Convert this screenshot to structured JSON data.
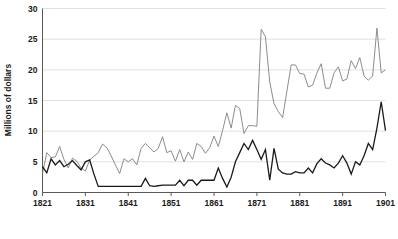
{
  "chart_data": {
    "type": "line",
    "title": "",
    "xlabel": "",
    "ylabel": "Millions of dollars",
    "xlim": [
      1821,
      1901
    ],
    "ylim": [
      0,
      30
    ],
    "grid": true,
    "legend_position": "bottom",
    "ytick_labels": [
      "0",
      "5",
      "10",
      "15",
      "20",
      "25",
      "30"
    ],
    "ytick_values": [
      0,
      5,
      10,
      15,
      20,
      25,
      30
    ],
    "xtick_labels": [
      "1821",
      "1831",
      "1841",
      "1851",
      "1861",
      "1871",
      "1881",
      "1891",
      "1901"
    ],
    "xtick_values": [
      1821,
      1831,
      1841,
      1851,
      1861,
      1871,
      1881,
      1891,
      1901
    ],
    "x": [
      1821,
      1822,
      1823,
      1824,
      1825,
      1826,
      1827,
      1828,
      1829,
      1830,
      1831,
      1832,
      1833,
      1834,
      1835,
      1836,
      1837,
      1838,
      1839,
      1840,
      1841,
      1842,
      1843,
      1844,
      1845,
      1846,
      1847,
      1848,
      1849,
      1850,
      1851,
      1852,
      1853,
      1854,
      1855,
      1856,
      1857,
      1858,
      1859,
      1860,
      1861,
      1862,
      1863,
      1864,
      1865,
      1866,
      1867,
      1868,
      1869,
      1870,
      1871,
      1872,
      1873,
      1874,
      1875,
      1876,
      1877,
      1878,
      1879,
      1880,
      1881,
      1882,
      1883,
      1884,
      1885,
      1886,
      1887,
      1888,
      1889,
      1890,
      1891,
      1892,
      1893,
      1894,
      1895,
      1896,
      1897,
      1898,
      1899,
      1900,
      1901
    ],
    "series": [
      {
        "name": "U.S. Imports from China",
        "color": "#808080",
        "values": [
          3.1,
          6.5,
          5.7,
          5.8,
          7.5,
          5.4,
          4.0,
          5.6,
          5.1,
          4.0,
          3.5,
          5.3,
          5.9,
          6.5,
          7.9,
          7.3,
          6.0,
          4.5,
          3.1,
          5.5,
          5.0,
          5.5,
          4.5,
          7.2,
          8.0,
          7.3,
          6.6,
          7.2,
          9.1,
          6.5,
          6.8,
          5.1,
          7.0,
          5.0,
          6.6,
          5.4,
          8.0,
          7.5,
          6.4,
          7.3,
          9.2,
          7.5,
          10.1,
          13.0,
          10.5,
          14.2,
          13.7,
          9.6,
          10.9,
          10.9,
          10.8,
          26.6,
          25.4,
          18.0,
          14.5,
          13.2,
          12.2,
          16.5,
          20.8,
          20.8,
          19.4,
          19.3,
          17.2,
          17.5,
          19.5,
          21.0,
          17.0,
          17.0,
          19.5,
          20.5,
          18.2,
          18.5,
          21.5,
          20.2,
          22.0,
          19.0,
          18.3,
          19.0,
          26.8,
          19.5,
          20.0
        ]
      },
      {
        "name": "U.S. Exports to China",
        "color": "#1a1a1a",
        "values": [
          4.2,
          3.2,
          5.5,
          4.5,
          5.2,
          4.2,
          4.6,
          5.2,
          4.4,
          3.7,
          5.0,
          5.3,
          3.0,
          1.0,
          1.0,
          1.0,
          1.0,
          1.0,
          1.0,
          1.0,
          1.0,
          1.0,
          1.0,
          1.0,
          2.3,
          1.1,
          1.0,
          1.1,
          1.2,
          1.2,
          1.2,
          1.2,
          2.0,
          1.1,
          2.0,
          2.0,
          1.2,
          2.0,
          2.0,
          2.0,
          2.0,
          4.0,
          2.3,
          0.9,
          2.5,
          5.0,
          6.5,
          8.0,
          7.0,
          8.5,
          7.0,
          5.4,
          7.0,
          2.0,
          7.2,
          3.8,
          3.2,
          3.0,
          3.0,
          3.4,
          3.2,
          3.2,
          4.0,
          3.2,
          4.7,
          5.5,
          4.8,
          4.5,
          4.0,
          4.8,
          6.0,
          4.8,
          3.0,
          5.0,
          4.5,
          6.0,
          8.0,
          7.0,
          10.5,
          14.8,
          10.1
        ]
      }
    ]
  },
  "axis": {
    "ylabel": "Millions of dollars"
  },
  "legend": {
    "items": [
      {
        "label": "U.S. Imports from China",
        "color": "#808080",
        "dash_glyph": "—"
      },
      {
        "label": "U.S. Exports to China",
        "color": "#1a1a1a",
        "dash_glyph": "—"
      }
    ]
  }
}
